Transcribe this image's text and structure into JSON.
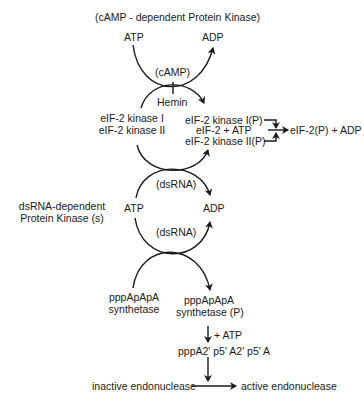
{
  "title": "(cAMP - dependent Protein Kinase)",
  "top_cycle": {
    "atp": "ATP",
    "adp": "ADP",
    "cofactor_upper": "(cAMP)",
    "cofactor_lower": "Hemin",
    "substrate_line1": "eIF-2 kinase I",
    "substrate_line2": "eIF-2 kinase II"
  },
  "phosphorylation": {
    "kinase1_p": "eIF-2 kinase I(P)",
    "reactants": "eIF-2 + ATP",
    "products": "eIF-2(P) + ADP",
    "kinase2_p": "eIF-2 kinase II(P)"
  },
  "dsrna_cycle": {
    "side_label_line1": "dsRNA-dependent",
    "side_label_line2": "Protein Kinase (s)",
    "atp": "ATP",
    "adp": "ADP",
    "cofactor_upper": "(dsRNA)",
    "cofactor_lower": "(dsRNA)"
  },
  "synthetase": {
    "left_line1": "pppApApA",
    "left_line2": "synthetase",
    "right_line1": "pppApApA",
    "right_line2": "synthetase (P)",
    "plus_atp": "+ ATP",
    "product": "pppA2' p5' A2' p5' A"
  },
  "endonuclease": {
    "inactive": "inactive endonuclease",
    "active": "active endonuclease"
  }
}
